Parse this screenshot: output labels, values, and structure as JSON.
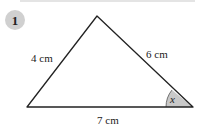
{
  "question": {
    "number": "1"
  },
  "triangle": {
    "sides": {
      "left": "4 cm",
      "right": "6 cm",
      "base": "7 cm"
    },
    "angle_label": "x",
    "colors": {
      "line": "#222222",
      "angle_fill": "#c8c8c8",
      "badge": "#d0d0d0"
    }
  }
}
